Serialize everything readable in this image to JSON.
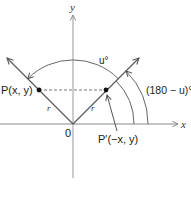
{
  "diagram": {
    "axes": {
      "x_label": "x",
      "y_label": "y",
      "origin_label": "0"
    },
    "points": {
      "p": {
        "label": "P(x, y)"
      },
      "p_prime": {
        "label": "P′(−x, y)"
      }
    },
    "segments": {
      "radius_left_label": "r",
      "radius_right_label": "r"
    },
    "angles": {
      "u_label": "u°",
      "supplement_label": "(180 − u)°"
    },
    "colors": {
      "line": "#555555",
      "axis": "#888888",
      "dash": "#777777",
      "point": "#111111"
    }
  }
}
